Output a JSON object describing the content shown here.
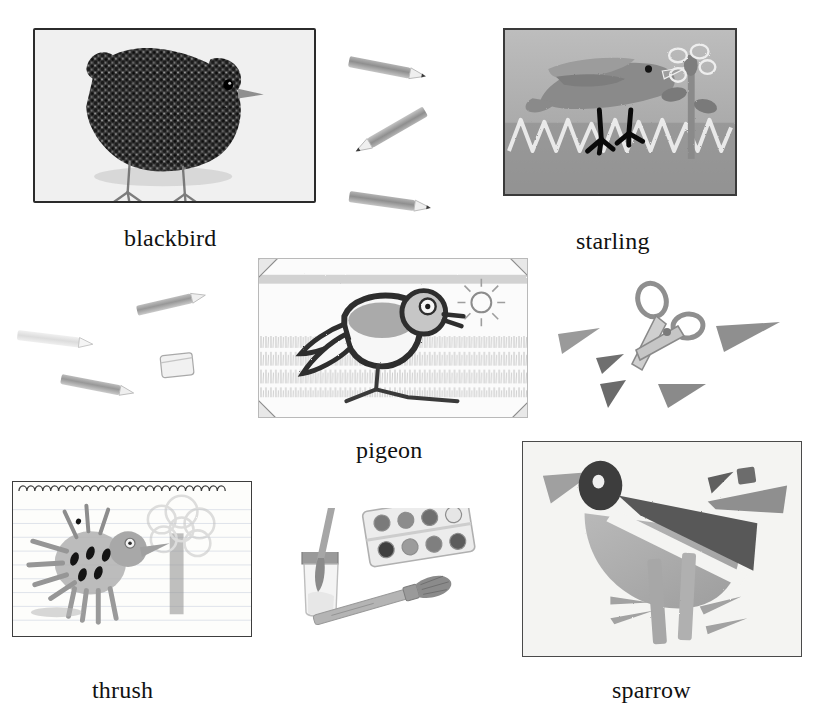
{
  "page": {
    "width": 822,
    "height": 727,
    "background": "#ffffff",
    "top_clipped_text": "",
    "theme": "children's bird drawings worksheet"
  },
  "palette": {
    "ink": "#111111",
    "frame_border": "#2b2b2b",
    "pencil_grey": "#8d8d8d",
    "paper_white": "#f4f4f2",
    "starling_bg": "#a8a8a8",
    "dark_shape": "#4e4e4e",
    "mid_grey": "#9a9a9a",
    "light_grey": "#c8c8c8",
    "accent_dark": "#2b2b2b"
  },
  "drawings": [
    {
      "id": "blackbird",
      "label": "blackbird",
      "medium": "pencil scribble drawing",
      "frame": {
        "x": 33,
        "y": 28,
        "w": 283,
        "h": 175
      },
      "caption": {
        "x": 124,
        "y": 225
      }
    },
    {
      "id": "starling",
      "label": "starling",
      "medium": "crayon / wax resist drawing",
      "frame": {
        "x": 503,
        "y": 28,
        "w": 234,
        "h": 168
      },
      "caption": {
        "x": 576,
        "y": 228
      }
    },
    {
      "id": "pigeon",
      "label": "pigeon",
      "medium": "charcoal and pencil drawing with photo corners",
      "frame": {
        "x": 258,
        "y": 258,
        "w": 270,
        "h": 160
      },
      "caption": {
        "x": 356,
        "y": 437
      }
    },
    {
      "id": "thrush",
      "label": "thrush",
      "medium": "pencil drawing on lined notepad paper",
      "frame": {
        "x": 12,
        "y": 481,
        "w": 240,
        "h": 156
      },
      "caption": {
        "x": 92,
        "y": 677
      }
    },
    {
      "id": "sparrow",
      "label": "sparrow",
      "medium": "torn paper collage",
      "frame": {
        "x": 522,
        "y": 441,
        "w": 280,
        "h": 216
      },
      "caption": {
        "x": 612,
        "y": 677
      }
    }
  ],
  "art_supplies": [
    {
      "id": "pencils-top",
      "name": "pencils",
      "count": 3,
      "region": {
        "x": 345,
        "y": 50,
        "w": 110,
        "h": 170
      },
      "items": [
        {
          "name": "pencil",
          "x": 352,
          "y": 55,
          "len": 78,
          "angle": 12
        },
        {
          "name": "pencil",
          "x": 352,
          "y": 120,
          "len": 80,
          "angle": -32
        },
        {
          "name": "pencil",
          "x": 352,
          "y": 193,
          "len": 82,
          "angle": 8
        }
      ]
    },
    {
      "id": "pencils-eraser-left",
      "name": "pencils and eraser",
      "count": 4,
      "region": {
        "x": 10,
        "y": 295,
        "w": 210,
        "h": 110
      },
      "items": [
        {
          "name": "pencil",
          "x": 135,
          "y": 300,
          "len": 68,
          "angle": -14
        },
        {
          "name": "pencil",
          "x": 18,
          "y": 330,
          "len": 70,
          "angle": 8
        },
        {
          "name": "eraser",
          "x": 160,
          "y": 357,
          "w": 32,
          "h": 24
        },
        {
          "name": "pencil",
          "x": 62,
          "y": 378,
          "len": 70,
          "angle": 12
        }
      ]
    },
    {
      "id": "scissors-cutouts",
      "name": "scissors with paper cut-outs",
      "count": 6,
      "region": {
        "x": 555,
        "y": 282,
        "w": 220,
        "h": 130
      },
      "items": [
        {
          "name": "scissors",
          "x": 630,
          "y": 285,
          "w": 86,
          "h": 78
        },
        {
          "name": "paper-triangle",
          "x": 560,
          "y": 332,
          "w": 38,
          "h": 22
        },
        {
          "name": "paper-triangle",
          "x": 597,
          "y": 355,
          "w": 26,
          "h": 18
        },
        {
          "name": "paper-triangle",
          "x": 600,
          "y": 382,
          "w": 30,
          "h": 24
        },
        {
          "name": "paper-triangle",
          "x": 658,
          "y": 382,
          "w": 42,
          "h": 22
        },
        {
          "name": "paper-triangle",
          "x": 715,
          "y": 325,
          "w": 62,
          "h": 26
        }
      ]
    },
    {
      "id": "paint-set",
      "name": "paint water jar, paint palette and paintbrush",
      "count": 3,
      "region": {
        "x": 295,
        "y": 510,
        "w": 180,
        "h": 160
      },
      "items": [
        {
          "name": "water-jar-with-brush",
          "x": 298,
          "y": 520,
          "w": 52,
          "h": 90
        },
        {
          "name": "paint-palette",
          "x": 365,
          "y": 518,
          "w": 95,
          "h": 52,
          "wells": 8
        },
        {
          "name": "paintbrush",
          "x": 320,
          "y": 605,
          "w": 130,
          "h": 50
        }
      ]
    }
  ],
  "icons": {
    "pencil": "pencil-icon",
    "eraser": "eraser-icon",
    "scissors": "scissors-icon",
    "palette": "paint-palette-icon",
    "brush": "paintbrush-icon",
    "jar": "water-jar-icon"
  }
}
